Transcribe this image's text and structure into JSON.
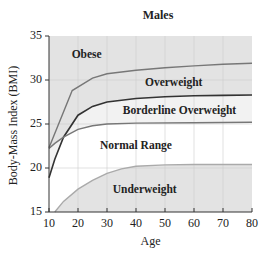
{
  "chart_data": {
    "type": "area",
    "title": "Males",
    "xlabel": "Age",
    "ylabel": "Body-Mass Index (BMI)",
    "xlim": [
      10,
      80
    ],
    "ylim": [
      15,
      35
    ],
    "x_ticks": [
      10,
      20,
      30,
      40,
      50,
      60,
      70,
      80
    ],
    "y_ticks": [
      15,
      20,
      25,
      30,
      35
    ],
    "grid": true,
    "series": [
      {
        "name": "Obese threshold",
        "points": [
          [
            10,
            22.3
          ],
          [
            18,
            28.8
          ],
          [
            25,
            30.2
          ],
          [
            30,
            30.7
          ],
          [
            40,
            31.1
          ],
          [
            50,
            31.4
          ],
          [
            60,
            31.6
          ],
          [
            70,
            31.8
          ],
          [
            80,
            31.9
          ]
        ]
      },
      {
        "name": "Overweight threshold",
        "points": [
          [
            10,
            18.9
          ],
          [
            12,
            21.0
          ],
          [
            15,
            23.5
          ],
          [
            20,
            26.0
          ],
          [
            25,
            27.0
          ],
          [
            30,
            27.5
          ],
          [
            40,
            27.9
          ],
          [
            50,
            28.1
          ],
          [
            60,
            28.2
          ],
          [
            70,
            28.25
          ],
          [
            80,
            28.3
          ]
        ]
      },
      {
        "name": "Borderline overweight threshold",
        "points": [
          [
            10,
            22.2
          ],
          [
            12,
            22.8
          ],
          [
            15,
            23.5
          ],
          [
            20,
            24.4
          ],
          [
            25,
            24.8
          ],
          [
            30,
            25.0
          ],
          [
            40,
            25.1
          ],
          [
            60,
            25.15
          ],
          [
            80,
            25.2
          ]
        ]
      },
      {
        "name": "Underweight threshold",
        "points": [
          [
            12,
            15.0
          ],
          [
            15,
            16.2
          ],
          [
            20,
            17.6
          ],
          [
            25,
            18.6
          ],
          [
            30,
            19.4
          ],
          [
            35,
            19.9
          ],
          [
            40,
            20.2
          ],
          [
            50,
            20.35
          ],
          [
            60,
            20.4
          ],
          [
            80,
            20.4
          ]
        ]
      }
    ],
    "region_labels": [
      {
        "text": "Obese",
        "x": 23,
        "y": 32.8
      },
      {
        "text": "Overweight",
        "x": 53,
        "y": 29.7
      },
      {
        "text": "Borderline Overweight",
        "x": 55,
        "y": 26.5
      },
      {
        "text": "Normal Range",
        "x": 40,
        "y": 22.5
      },
      {
        "text": "Underweight",
        "x": 43,
        "y": 17.5
      }
    ],
    "colors": {
      "shaded": "#e3e3e3",
      "band_light": "#f2f2f2",
      "normal": "#ffffff",
      "line_dark": "#333333",
      "line_mid": "#777777",
      "line_light": "#aaaaaa",
      "grid": "#cfcfcf"
    }
  }
}
